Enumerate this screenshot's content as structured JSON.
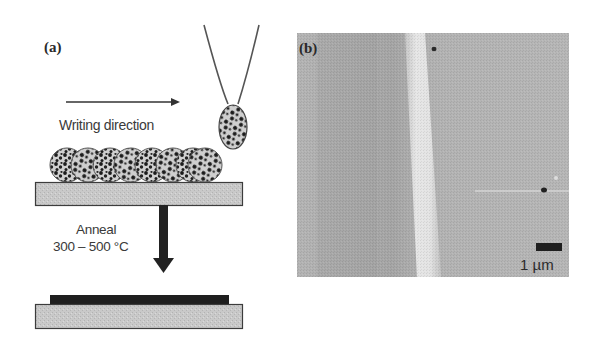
{
  "figure": {
    "panel_a": {
      "label": "(a)",
      "writing_arrow_label": "Writing direction",
      "anneal_label": "Anneal",
      "anneal_temperature": "300 – 500 °C",
      "particle_count": 8,
      "elements": [
        "pen-tip",
        "ink-droplet",
        "writing-direction-arrow",
        "deposited-particle-row",
        "substrate-before",
        "anneal-arrow",
        "annealed-film",
        "substrate-after"
      ]
    },
    "panel_b": {
      "label": "(b)",
      "scale_bar_label": "1 µm",
      "description": "grayscale microscope image of written line"
    },
    "colors": {
      "substrate_fill": "#c8c8c8",
      "outline": "#3c3c3c",
      "film": "#1f1f1f",
      "afm_background": "#a9a9a9",
      "afm_stripe": "#e2e2e2",
      "text": "#3a3a3a"
    }
  }
}
